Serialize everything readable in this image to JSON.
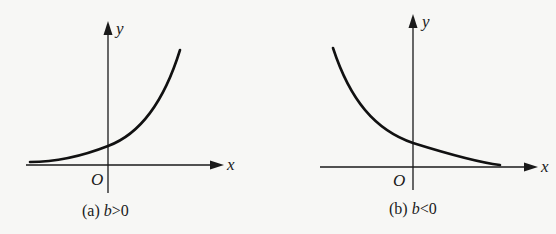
{
  "panels": [
    {
      "id": "a",
      "caption_prefix": "(a) ",
      "caption_var": "b",
      "caption_rel": ">0",
      "x_axis_label": "x",
      "y_axis_label": "y",
      "origin_label": "O",
      "curve": "increasing exponential (growth)"
    },
    {
      "id": "b",
      "caption_prefix": "(b) ",
      "caption_var": "b",
      "caption_rel": "<0",
      "x_axis_label": "x",
      "y_axis_label": "y",
      "origin_label": "O",
      "curve": "decreasing exponential (decay)"
    }
  ],
  "colors": {
    "background": "#f7f7f5",
    "ink": "#1a1a1a"
  }
}
